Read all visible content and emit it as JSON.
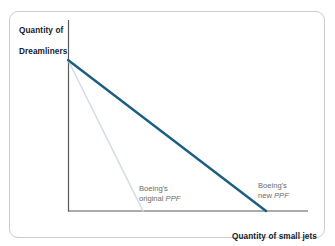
{
  "figure": {
    "type": "ppf-graph",
    "background_color": "#ffffff",
    "frame_color": "#c9cdd2"
  },
  "axes": {
    "y_label_line1": "Quantity of",
    "y_label_line2": "Dreamliners",
    "x_label": "Quantity of small jets",
    "axis_color": "#595959",
    "label_color": "#15202b"
  },
  "labels": {
    "original": {
      "line1": "Boeing's",
      "line2_prefix": "original ",
      "line2_italic": "PPF",
      "color": "#6b6b6b"
    },
    "new": {
      "line1": "Boeing's",
      "line2_prefix": "new ",
      "line2_italic": "PPF",
      "color": "#6b6b6b"
    }
  },
  "chart_data": {
    "type": "line",
    "title": "",
    "xlabel": "Quantity of small jets",
    "ylabel": "Quantity of Dreamliners",
    "grid": false,
    "legend": "inline-annotations",
    "axis_origin_px": [
      68,
      211
    ],
    "x_axis_end_px": [
      308,
      211
    ],
    "y_axis_top_px": [
      68,
      20
    ],
    "series": [
      {
        "name": "Boeing's original PPF",
        "color": "#d5dce4",
        "width_px": 1.6,
        "points_px": [
          [
            68,
            60
          ],
          [
            143,
            211
          ]
        ],
        "x": [
          0,
          1
        ],
        "y": [
          1,
          0
        ],
        "x_intercept_rel": 0.31,
        "y_intercept_rel": 1.0
      },
      {
        "name": "Boeing's new PPF",
        "color": "#1b5e82",
        "width_px": 2.4,
        "points_px": [
          [
            68,
            60
          ],
          [
            266,
            211
          ]
        ],
        "x": [
          0,
          1
        ],
        "y": [
          1,
          0
        ],
        "x_intercept_rel": 0.825,
        "y_intercept_rel": 1.0
      }
    ],
    "xlim": [
      0,
      1
    ],
    "ylim": [
      0,
      1
    ],
    "annotations": [
      {
        "text": "Boeing's original PPF",
        "x_px": 139,
        "y_px": 184
      },
      {
        "text": "Boeing's new PPF",
        "x_px": 258,
        "y_px": 181
      }
    ]
  }
}
